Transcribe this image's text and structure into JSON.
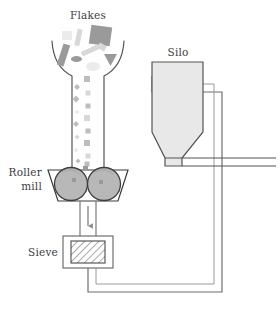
{
  "diagram": {
    "type": "process-flow",
    "background_color": "#ffffff",
    "labels": {
      "flakes": "Flakes",
      "roller_mill_line1": "Roller",
      "roller_mill_line2": "mill",
      "sieve": "Sieve",
      "silo": "Silo"
    },
    "colors": {
      "outline": "#555555",
      "outline_dark": "#3a3a3a",
      "pipe_fill": "#ffffff",
      "pipe_edge": "#6e6e6e",
      "vessel_fill": "#e8e8e8",
      "roller_fill": "#b8b8b8",
      "roller_edge": "#3f3f3f",
      "sieve_fill": "#f2f2f2",
      "sieve_hatch": "#5a5a5a",
      "flake_dark": "#9a9a9a",
      "flake_mid": "#bdbdbd",
      "flake_light": "#d8d8d8",
      "flake_pale": "#ebebeb",
      "text": "#3d3d3d",
      "arrow": "#8a8a8a"
    },
    "components": [
      {
        "name": "feed-hopper",
        "label": "Flakes",
        "shape": "funnel",
        "description": "Open funnel at top receiving flake material"
      },
      {
        "name": "roller-mill",
        "label": "Roller mill",
        "shape": "trapezoid-with-two-rollers",
        "roller_count": 2
      },
      {
        "name": "sieve",
        "label": "Sieve",
        "shape": "hatched-square-in-box"
      },
      {
        "name": "silo",
        "label": "Silo",
        "shape": "rectangle-with-conical-bottom"
      },
      {
        "name": "return-pipe",
        "label": "",
        "shape": "polyline",
        "description": "Pipe from sieve outlet around bottom and up to silo inlet"
      },
      {
        "name": "silo-outlet-pipe",
        "label": "",
        "shape": "horizontal-pipe",
        "description": "Discharge pipe leaving silo cone to the right"
      }
    ],
    "flakes_large": [
      {
        "id": "flake-1",
        "type": "rect",
        "x": 60,
        "y": 44,
        "w": 7,
        "h": 22,
        "rot": 18,
        "tone": "flake_dark"
      },
      {
        "id": "flake-2",
        "type": "rect",
        "x": 76,
        "y": 29,
        "w": 5,
        "h": 17,
        "rot": 12,
        "tone": "flake_light"
      },
      {
        "id": "flake-3",
        "type": "rect",
        "x": 90,
        "y": 26,
        "w": 21,
        "h": 19,
        "rot": 8,
        "tone": "flake_dark"
      },
      {
        "id": "flake-4",
        "type": "rect",
        "x": 81,
        "y": 48,
        "w": 18,
        "h": 5,
        "rot": -25,
        "tone": "flake_light"
      },
      {
        "id": "flake-5",
        "type": "ellipse",
        "x": 71,
        "y": 56,
        "w": 11,
        "h": 6,
        "rot": 0,
        "tone": "flake_dark"
      },
      {
        "id": "flake-6",
        "type": "tri",
        "x": 104,
        "y": 54,
        "w": 13,
        "h": 12,
        "rot": 0,
        "tone": "flake_dark"
      },
      {
        "id": "flake-7",
        "type": "ellipse",
        "x": 86,
        "y": 62,
        "w": 14,
        "h": 9,
        "rot": 0,
        "tone": "flake_pale"
      },
      {
        "id": "flake-8",
        "type": "rect",
        "x": 62,
        "y": 31,
        "w": 10,
        "h": 9,
        "rot": 0,
        "tone": "flake_pale"
      },
      {
        "id": "flake-9",
        "type": "rect",
        "x": 98,
        "y": 44,
        "w": 8,
        "h": 6,
        "rot": 30,
        "tone": "flake_light"
      }
    ],
    "particles": [
      {
        "id": "p-1",
        "type": "rect",
        "x": 87,
        "y": 79,
        "s": 6,
        "tone": "flake_mid"
      },
      {
        "id": "p-2",
        "type": "diam",
        "x": 77,
        "y": 87,
        "s": 6,
        "tone": "flake_mid"
      },
      {
        "id": "p-3",
        "type": "rect",
        "x": 88,
        "y": 93,
        "s": 5,
        "tone": "flake_light"
      },
      {
        "id": "p-4",
        "type": "diam",
        "x": 76,
        "y": 99,
        "s": 7,
        "tone": "flake_mid"
      },
      {
        "id": "p-5",
        "type": "rect",
        "x": 88,
        "y": 106,
        "s": 5,
        "tone": "flake_mid"
      },
      {
        "id": "p-6",
        "type": "diam",
        "x": 77,
        "y": 112,
        "s": 5,
        "tone": "flake_pale"
      },
      {
        "id": "p-7",
        "type": "rect",
        "x": 87,
        "y": 118,
        "s": 6,
        "tone": "flake_light"
      },
      {
        "id": "p-8",
        "type": "diam",
        "x": 76,
        "y": 124,
        "s": 6,
        "tone": "flake_mid"
      },
      {
        "id": "p-9",
        "type": "rect",
        "x": 88,
        "y": 131,
        "s": 5,
        "tone": "flake_mid"
      },
      {
        "id": "p-10",
        "type": "diam",
        "x": 77,
        "y": 137,
        "s": 5,
        "tone": "flake_light"
      },
      {
        "id": "p-11",
        "type": "rect",
        "x": 87,
        "y": 143,
        "s": 6,
        "tone": "flake_mid"
      },
      {
        "id": "p-12",
        "type": "diam",
        "x": 76,
        "y": 150,
        "s": 5,
        "tone": "flake_pale"
      },
      {
        "id": "p-13",
        "type": "rect",
        "x": 88,
        "y": 156,
        "s": 5,
        "tone": "flake_light"
      },
      {
        "id": "p-14",
        "type": "diam",
        "x": 78,
        "y": 161,
        "s": 5,
        "tone": "flake_mid"
      },
      {
        "id": "p-15",
        "type": "rect",
        "x": 87,
        "y": 164,
        "s": 5,
        "tone": "flake_mid"
      }
    ]
  }
}
